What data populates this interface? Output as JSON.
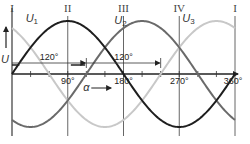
{
  "chart_data": {
    "type": "line",
    "title": "",
    "xlabel": "α",
    "ylabel": "U",
    "xlim": [
      0,
      360
    ],
    "x_unit": "degrees",
    "x_tick_labels": [
      "90°",
      "180°",
      "270°",
      "360°"
    ],
    "x_tick_values": [
      90,
      180,
      270,
      360
    ],
    "minor_tick_step": 30,
    "phase_lines": [
      {
        "label": "I",
        "x": 0
      },
      {
        "label": "II",
        "x": 90
      },
      {
        "label": "III",
        "x": 180
      },
      {
        "label": "IV",
        "x": 270
      },
      {
        "label": "I",
        "x": 360
      }
    ],
    "series": [
      {
        "name": "U1",
        "label_main": "U",
        "label_sub": "1",
        "function": "sin(α)",
        "phase_deg": 0,
        "color": "#1e1e1e"
      },
      {
        "name": "U2",
        "label_main": "U",
        "label_sub": "2",
        "function": "sin(α-120°)",
        "phase_deg": 120,
        "color": "#6a6a6a"
      },
      {
        "name": "U3",
        "label_main": "U",
        "label_sub": "3",
        "function": "sin(α-240°)",
        "phase_deg": 240,
        "color": "#c8c8c8"
      }
    ],
    "annotations": [
      {
        "text": "120°",
        "from": 0,
        "to": 120
      },
      {
        "text": "120°",
        "from": 120,
        "to": 240
      }
    ],
    "amplitude": 1
  }
}
